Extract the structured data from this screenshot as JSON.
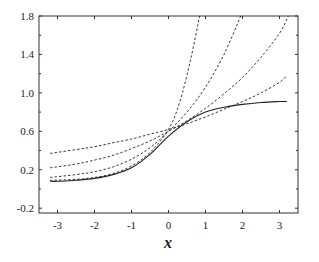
{
  "chart_data": {
    "type": "line",
    "title": "",
    "xlabel": "x",
    "ylabel": "",
    "xlim": [
      -3.5,
      3.5
    ],
    "ylim": [
      -0.25,
      1.8
    ],
    "grid": false,
    "legend": "none",
    "x_ticks": [
      -3,
      -2,
      -1,
      0,
      1,
      2,
      3
    ],
    "x_tick_labels": [
      "-3",
      "-2",
      "-1",
      "0",
      "1",
      "2",
      "3"
    ],
    "y_ticks": [
      -0.2,
      0.2,
      0.6,
      1.0,
      1.4,
      1.8
    ],
    "y_tick_labels": [
      "-0.2",
      "0.2",
      "0.6",
      "1.0",
      "1.4",
      "1.8"
    ],
    "y_minor_ticks": [
      0.0,
      0.4,
      0.8,
      1.2,
      1.6
    ],
    "series": [
      {
        "name": "exact",
        "style": "solid",
        "x": [
          -3.2,
          -3,
          -2.5,
          -2,
          -1.5,
          -1,
          -0.5,
          0,
          0.5,
          1,
          1.5,
          2,
          2.5,
          3,
          3.2
        ],
        "values": [
          0.08,
          0.08,
          0.09,
          0.11,
          0.15,
          0.22,
          0.36,
          0.55,
          0.7,
          0.8,
          0.85,
          0.88,
          0.9,
          0.91,
          0.91
        ]
      },
      {
        "name": "approx-1",
        "style": "dashed",
        "x": [
          -3.2,
          -2.5,
          -2,
          -1.5,
          -1,
          -0.5,
          0,
          0.3,
          0.6,
          0.84
        ],
        "values": [
          0.09,
          0.1,
          0.12,
          0.16,
          0.24,
          0.38,
          0.62,
          0.9,
          1.35,
          1.8
        ]
      },
      {
        "name": "approx-2",
        "style": "dashed",
        "x": [
          -3.2,
          -2.5,
          -2,
          -1.5,
          -1,
          -0.5,
          0,
          0.5,
          1,
          1.5,
          1.95
        ],
        "values": [
          0.12,
          0.15,
          0.18,
          0.23,
          0.31,
          0.43,
          0.6,
          0.8,
          1.06,
          1.4,
          1.8
        ]
      },
      {
        "name": "approx-3",
        "style": "dashed",
        "x": [
          -3.2,
          -2.5,
          -2,
          -1.5,
          -1,
          -0.5,
          0,
          0.5,
          1,
          1.5,
          2,
          2.5,
          3,
          3.24
        ],
        "values": [
          0.22,
          0.26,
          0.3,
          0.35,
          0.42,
          0.5,
          0.6,
          0.71,
          0.84,
          0.99,
          1.16,
          1.37,
          1.62,
          1.8
        ]
      },
      {
        "name": "approx-4",
        "style": "dashed",
        "x": [
          -3.2,
          -2.5,
          -2,
          -1.5,
          -1,
          -0.5,
          0,
          0.5,
          1,
          1.5,
          2,
          2.5,
          3,
          3.2
        ],
        "values": [
          0.37,
          0.41,
          0.44,
          0.48,
          0.52,
          0.57,
          0.62,
          0.68,
          0.75,
          0.83,
          0.91,
          1.0,
          1.11,
          1.18
        ]
      }
    ]
  }
}
